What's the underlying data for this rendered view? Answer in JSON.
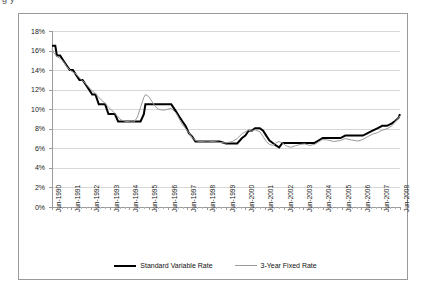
{
  "title_fragment": "g                                                                    y",
  "legend": {
    "items": [
      {
        "label": "Standard Variable Rate",
        "style": "thick-black",
        "color": "#000000"
      },
      {
        "label": "3-Year Fixed Rate",
        "style": "thin-grey",
        "color": "#9a9a9a"
      }
    ]
  },
  "chart_data": {
    "type": "line",
    "title": "",
    "xlabel": "",
    "ylabel": "",
    "ylim": [
      0,
      18
    ],
    "ytick_labels": [
      "0%",
      "2%",
      "4%",
      "6%",
      "8%",
      "10%",
      "12%",
      "14%",
      "16%",
      "18%"
    ],
    "ytick_values": [
      0,
      2,
      4,
      6,
      8,
      10,
      12,
      14,
      16,
      18
    ],
    "grid": true,
    "legend_position": "bottom",
    "xtick_labels": [
      "Jun-1990",
      "Jun-1991",
      "Jun-1992",
      "Jun-1993",
      "Jun-1994",
      "Jun-1995",
      "Jun-1996",
      "Jun-1997",
      "Jun-1998",
      "Jun-1999",
      "Jun-2000",
      "Jun-2001",
      "Jun-2002",
      "Jun-2003",
      "Jun-2004",
      "Jun-2005",
      "Jun-2006",
      "Jun-2007",
      "Jun-2008"
    ],
    "xtick_values": [
      1990,
      1991,
      1992,
      1993,
      1994,
      1995,
      1996,
      1997,
      1998,
      1999,
      2000,
      2001,
      2002,
      2003,
      2004,
      2005,
      2006,
      2007,
      2008
    ],
    "xlim": [
      1990,
      2008
    ],
    "series": [
      {
        "name": "Standard Variable Rate",
        "color": "#000000",
        "width": 2,
        "points": [
          [
            1990.0,
            16.5
          ],
          [
            1990.17,
            16.5
          ],
          [
            1990.25,
            15.5
          ],
          [
            1990.42,
            15.5
          ],
          [
            1990.58,
            15.0
          ],
          [
            1990.75,
            14.5
          ],
          [
            1990.92,
            14.0
          ],
          [
            1991.08,
            14.0
          ],
          [
            1991.25,
            13.5
          ],
          [
            1991.42,
            13.0
          ],
          [
            1991.58,
            13.0
          ],
          [
            1991.75,
            12.5
          ],
          [
            1991.92,
            12.0
          ],
          [
            1992.08,
            11.5
          ],
          [
            1992.25,
            11.5
          ],
          [
            1992.42,
            10.5
          ],
          [
            1992.58,
            10.5
          ],
          [
            1992.75,
            10.5
          ],
          [
            1992.92,
            9.5
          ],
          [
            1993.08,
            9.5
          ],
          [
            1993.25,
            9.5
          ],
          [
            1993.42,
            8.75
          ],
          [
            1993.58,
            8.75
          ],
          [
            1993.83,
            8.75
          ],
          [
            1994.08,
            8.75
          ],
          [
            1994.25,
            8.75
          ],
          [
            1994.42,
            8.75
          ],
          [
            1994.58,
            8.75
          ],
          [
            1994.75,
            9.5
          ],
          [
            1994.83,
            10.5
          ],
          [
            1995.0,
            10.5
          ],
          [
            1995.25,
            10.5
          ],
          [
            1995.5,
            10.5
          ],
          [
            1995.75,
            10.5
          ],
          [
            1996.0,
            10.5
          ],
          [
            1996.17,
            10.5
          ],
          [
            1996.42,
            9.75
          ],
          [
            1996.58,
            9.25
          ],
          [
            1996.75,
            8.75
          ],
          [
            1996.92,
            8.25
          ],
          [
            1997.08,
            7.55
          ],
          [
            1997.25,
            7.2
          ],
          [
            1997.42,
            6.7
          ],
          [
            1997.67,
            6.7
          ],
          [
            1998.0,
            6.7
          ],
          [
            1998.33,
            6.7
          ],
          [
            1998.67,
            6.7
          ],
          [
            1999.0,
            6.5
          ],
          [
            1999.33,
            6.5
          ],
          [
            1999.58,
            6.5
          ],
          [
            1999.83,
            7.05
          ],
          [
            2000.0,
            7.3
          ],
          [
            2000.17,
            7.8
          ],
          [
            2000.33,
            7.8
          ],
          [
            2000.5,
            8.05
          ],
          [
            2000.75,
            8.05
          ],
          [
            2000.92,
            7.8
          ],
          [
            2001.08,
            7.3
          ],
          [
            2001.25,
            6.8
          ],
          [
            2001.42,
            6.55
          ],
          [
            2001.58,
            6.3
          ],
          [
            2001.75,
            6.1
          ],
          [
            2001.92,
            6.55
          ],
          [
            2002.08,
            6.55
          ],
          [
            2002.33,
            6.55
          ],
          [
            2002.58,
            6.55
          ],
          [
            2002.83,
            6.55
          ],
          [
            2003.08,
            6.55
          ],
          [
            2003.33,
            6.55
          ],
          [
            2003.58,
            6.55
          ],
          [
            2003.83,
            6.85
          ],
          [
            2004.0,
            7.05
          ],
          [
            2004.25,
            7.05
          ],
          [
            2004.58,
            7.05
          ],
          [
            2004.92,
            7.05
          ],
          [
            2005.17,
            7.3
          ],
          [
            2005.5,
            7.3
          ],
          [
            2005.83,
            7.3
          ],
          [
            2006.08,
            7.3
          ],
          [
            2006.33,
            7.55
          ],
          [
            2006.58,
            7.8
          ],
          [
            2006.83,
            8.05
          ],
          [
            2007.08,
            8.3
          ],
          [
            2007.33,
            8.3
          ],
          [
            2007.58,
            8.55
          ],
          [
            2007.75,
            8.8
          ],
          [
            2007.92,
            9.1
          ],
          [
            2008.0,
            9.5
          ]
        ]
      },
      {
        "name": "3-Year Fixed Rate",
        "color": "#9a9a9a",
        "width": 1,
        "points": [
          [
            1990.0,
            16.2
          ],
          [
            1990.08,
            15.8
          ],
          [
            1990.25,
            15.4
          ],
          [
            1990.42,
            15.2
          ],
          [
            1990.58,
            14.9
          ],
          [
            1990.75,
            14.4
          ],
          [
            1990.92,
            14.0
          ],
          [
            1991.08,
            13.8
          ],
          [
            1991.25,
            13.6
          ],
          [
            1991.42,
            13.2
          ],
          [
            1991.58,
            12.9
          ],
          [
            1991.75,
            12.6
          ],
          [
            1991.92,
            12.2
          ],
          [
            1992.08,
            11.9
          ],
          [
            1992.25,
            11.6
          ],
          [
            1992.42,
            11.2
          ],
          [
            1992.58,
            10.9
          ],
          [
            1992.75,
            10.6
          ],
          [
            1992.92,
            10.2
          ],
          [
            1993.08,
            9.9
          ],
          [
            1993.25,
            9.6
          ],
          [
            1993.42,
            9.2
          ],
          [
            1993.58,
            8.9
          ],
          [
            1993.83,
            8.75
          ],
          [
            1994.08,
            8.7
          ],
          [
            1994.25,
            8.7
          ],
          [
            1994.42,
            9.2
          ],
          [
            1994.58,
            10.2
          ],
          [
            1994.75,
            11.2
          ],
          [
            1994.83,
            11.5
          ],
          [
            1995.0,
            11.3
          ],
          [
            1995.17,
            10.8
          ],
          [
            1995.33,
            10.3
          ],
          [
            1995.5,
            10.0
          ],
          [
            1995.75,
            9.9
          ],
          [
            1996.0,
            10.0
          ],
          [
            1996.17,
            10.1
          ],
          [
            1996.42,
            9.6
          ],
          [
            1996.58,
            9.0
          ],
          [
            1996.75,
            8.4
          ],
          [
            1996.92,
            8.0
          ],
          [
            1997.08,
            7.6
          ],
          [
            1997.25,
            7.1
          ],
          [
            1997.42,
            6.8
          ],
          [
            1997.67,
            6.7
          ],
          [
            1998.0,
            6.75
          ],
          [
            1998.33,
            6.7
          ],
          [
            1998.67,
            6.6
          ],
          [
            1999.0,
            6.55
          ],
          [
            1999.33,
            6.7
          ],
          [
            1999.58,
            7.0
          ],
          [
            1999.83,
            7.5
          ],
          [
            2000.0,
            7.7
          ],
          [
            2000.17,
            7.85
          ],
          [
            2000.33,
            7.75
          ],
          [
            2000.5,
            7.9
          ],
          [
            2000.75,
            7.7
          ],
          [
            2000.92,
            7.2
          ],
          [
            2001.08,
            6.7
          ],
          [
            2001.25,
            6.4
          ],
          [
            2001.42,
            6.3
          ],
          [
            2001.58,
            6.55
          ],
          [
            2001.75,
            6.7
          ],
          [
            2001.92,
            6.55
          ],
          [
            2002.08,
            6.3
          ],
          [
            2002.33,
            6.1
          ],
          [
            2002.58,
            6.25
          ],
          [
            2002.83,
            6.4
          ],
          [
            2003.08,
            6.45
          ],
          [
            2003.33,
            6.3
          ],
          [
            2003.58,
            6.4
          ],
          [
            2003.83,
            6.7
          ],
          [
            2004.0,
            6.9
          ],
          [
            2004.25,
            6.85
          ],
          [
            2004.58,
            6.7
          ],
          [
            2004.92,
            6.8
          ],
          [
            2005.17,
            7.0
          ],
          [
            2005.5,
            6.85
          ],
          [
            2005.83,
            6.75
          ],
          [
            2006.08,
            6.9
          ],
          [
            2006.33,
            7.2
          ],
          [
            2006.58,
            7.45
          ],
          [
            2006.83,
            7.6
          ],
          [
            2007.08,
            7.85
          ],
          [
            2007.33,
            8.0
          ],
          [
            2007.58,
            8.3
          ],
          [
            2007.75,
            8.7
          ],
          [
            2007.92,
            9.1
          ],
          [
            2008.0,
            9.35
          ]
        ]
      }
    ]
  }
}
